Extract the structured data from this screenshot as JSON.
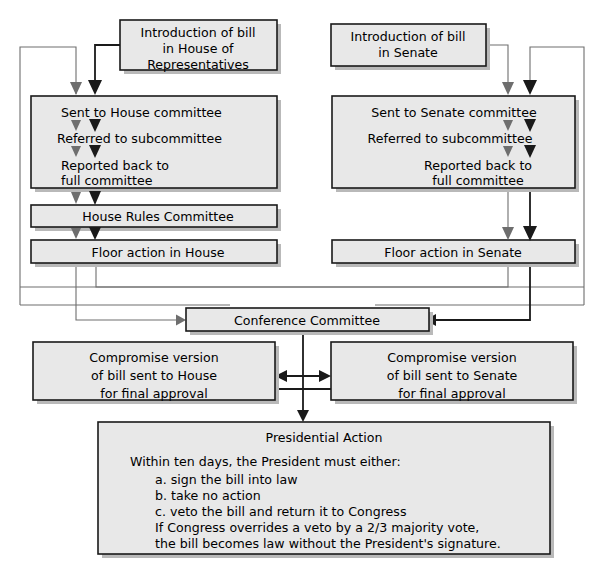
{
  "diagram": {
    "colors": {
      "box_fill": "#e8e8e8",
      "box_stroke": "#1a1a1a",
      "shadow": "#b9b9b9",
      "connector_thin": "#6e6e6e",
      "connector_thick": "#1a1a1a",
      "background": "#ffffff"
    },
    "nodes": {
      "house_intro": {
        "lines": [
          "Introduction of bill",
          "in House of",
          "Representatives"
        ]
      },
      "senate_intro": {
        "lines": [
          "Introduction of bill",
          "in Senate"
        ]
      },
      "house_committee": {
        "lines": [
          "Sent to House committee",
          "Referred to subcommittee",
          "Reported back to",
          "full committee"
        ]
      },
      "senate_committee": {
        "lines": [
          "Sent to Senate committee",
          "Referred to subcommittee",
          "Reported back to",
          "full committee"
        ]
      },
      "house_rules": {
        "lines": [
          "House Rules Committee"
        ]
      },
      "floor_house": {
        "lines": [
          "Floor action in House"
        ]
      },
      "floor_senate": {
        "lines": [
          "Floor action in Senate"
        ]
      },
      "conference": {
        "lines": [
          "Conference Committee"
        ]
      },
      "compromise_house": {
        "lines": [
          "Compromise version",
          "of bill sent to House",
          "for final approval"
        ]
      },
      "compromise_senate": {
        "lines": [
          "Compromise version",
          "of bill sent to Senate",
          "for final approval"
        ]
      },
      "presidential_action": {
        "heading": "Presidential Action",
        "lines": [
          "Within ten days, the President must either:",
          "a. sign the bill into law",
          "b. take no action",
          "c. veto the bill and return it to Congress",
          "If Congress overrides a veto by a 2/3 majority vote,",
          "the bill becomes law without the President's signature."
        ]
      }
    }
  }
}
